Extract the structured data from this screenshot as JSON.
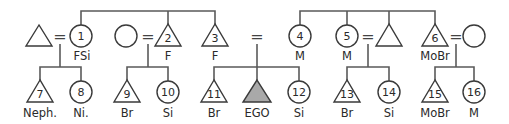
{
  "diagram": {
    "type": "kinship-diagram",
    "marriage_symbol": "=",
    "ego_fill": "#a9a9a9",
    "gen1": {
      "left_spouse": {
        "shape": "triangle",
        "number": "",
        "label": ""
      },
      "p1": {
        "shape": "circle",
        "number": "1",
        "label": "FSi"
      },
      "unnamed_circle": {
        "shape": "circle",
        "number": "",
        "label": ""
      },
      "p2": {
        "shape": "triangle",
        "number": "2",
        "label": "F"
      },
      "p3": {
        "shape": "triangle",
        "number": "3",
        "label": "F"
      },
      "p4": {
        "shape": "circle",
        "number": "4",
        "label": "M"
      },
      "p5": {
        "shape": "circle",
        "number": "5",
        "label": "M"
      },
      "unnamed_triangle": {
        "shape": "triangle",
        "number": "",
        "label": ""
      },
      "p6": {
        "shape": "triangle",
        "number": "6",
        "label": "MoBr"
      },
      "right_spouse": {
        "shape": "circle",
        "number": "",
        "label": ""
      }
    },
    "gen2": {
      "p7": {
        "shape": "triangle",
        "number": "7",
        "label": "Neph."
      },
      "p8": {
        "shape": "circle",
        "number": "8",
        "label": "Ni."
      },
      "p9": {
        "shape": "triangle",
        "number": "9",
        "label": "Br"
      },
      "p10": {
        "shape": "circle",
        "number": "10",
        "label": "Si"
      },
      "p11": {
        "shape": "triangle",
        "number": "11",
        "label": "Br"
      },
      "ego": {
        "shape": "triangle",
        "number": "",
        "label": "EGO"
      },
      "p12": {
        "shape": "circle",
        "number": "12",
        "label": "Si"
      },
      "p13": {
        "shape": "triangle",
        "number": "13",
        "label": "Br"
      },
      "p14": {
        "shape": "circle",
        "number": "14",
        "label": "Si"
      },
      "p15": {
        "shape": "triangle",
        "number": "15",
        "label": "MoBr"
      },
      "p16": {
        "shape": "circle",
        "number": "16",
        "label": "M"
      }
    }
  }
}
